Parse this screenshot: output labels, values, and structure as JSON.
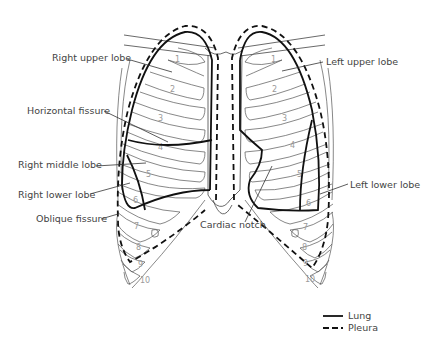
{
  "diagram": {
    "labels": {
      "right_upper_lobe": "Right upper lobe",
      "horizontal_fissure": "Horizontal fissure",
      "right_middle_lobe": "Right middle lobe",
      "right_lower_lobe": "Right lower lobe",
      "oblique_fissure": "Oblique fissure",
      "left_upper_lobe": "Left upper lobe",
      "left_lower_lobe": "Left lower lobe",
      "cardiac_notch": "Cardiac notch"
    },
    "rib_numbers_right": [
      "1",
      "2",
      "3",
      "4",
      "5",
      "6",
      "7",
      "8",
      "9",
      "10"
    ],
    "rib_numbers_left": [
      "1",
      "2",
      "3",
      "4",
      "5",
      "6",
      "7",
      "8",
      "9",
      "10"
    ],
    "legend": {
      "items": [
        {
          "label": "Lung",
          "style": "solid"
        },
        {
          "label": "Pleura",
          "style": "dashed"
        }
      ]
    },
    "colors": {
      "outline": "#111111",
      "rib": "#555555",
      "label_text": "#444444",
      "rib_number": "#9a9a9a",
      "background": "#ffffff"
    }
  }
}
